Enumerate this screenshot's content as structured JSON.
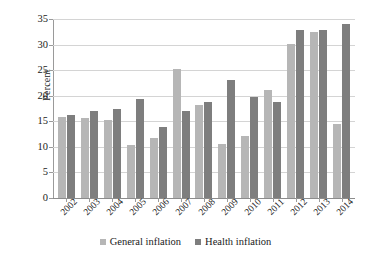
{
  "chart_data": {
    "type": "bar",
    "title": "",
    "xlabel": "",
    "ylabel": "Percent",
    "ylim": [
      0,
      35
    ],
    "yticks": [
      0,
      5,
      10,
      15,
      20,
      25,
      30,
      35
    ],
    "grid": true,
    "legend_position": "bottom",
    "categories": [
      "2002",
      "2003",
      "2004",
      "2005",
      "2006",
      "2007",
      "2008",
      "2009",
      "2010",
      "2011",
      "2012",
      "2013",
      "2014"
    ],
    "series": [
      {
        "name": "General inflation",
        "color": "#b6b6b6",
        "values": [
          15.8,
          15.6,
          15.3,
          10.3,
          11.7,
          25.3,
          18.2,
          10.5,
          12.2,
          21.2,
          30.1,
          32.4,
          14.5
        ]
      },
      {
        "name": "Health inflation",
        "color": "#7e7e7e",
        "values": [
          16.3,
          17.0,
          17.4,
          19.3,
          13.8,
          17.0,
          18.8,
          23.1,
          19.7,
          18.7,
          32.8,
          32.8,
          34.1
        ]
      }
    ]
  },
  "legend": {
    "items": [
      {
        "label": "General inflation",
        "swatch": "general"
      },
      {
        "label": "Health inflation",
        "swatch": "health"
      }
    ]
  }
}
